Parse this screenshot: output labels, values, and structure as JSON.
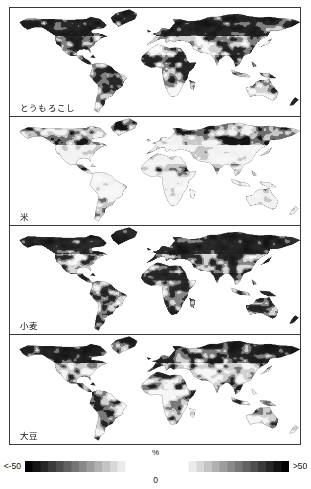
{
  "figure": {
    "panel_count": 4
  },
  "panels": [
    {
      "label": "とうもろこし",
      "crop_en": "maize"
    },
    {
      "label": "米",
      "crop_en": "rice"
    },
    {
      "label": "小麦",
      "crop_en": "wheat"
    },
    {
      "label": "大豆",
      "crop_en": "soybean"
    }
  ],
  "legend": {
    "left_label": "<-50",
    "right_label": ">50",
    "unit": "%",
    "center_label": "0",
    "low_color": "#000000",
    "high_color": "#000000",
    "mid_color": "#ffffff"
  },
  "chart_data": {
    "type": "heatmap",
    "subtitle": "",
    "xlabel": "",
    "ylabel": "",
    "grid": false,
    "legend_position": "bottom",
    "colorbar": {
      "unit": "%",
      "segments": [
        {
          "name": "negative",
          "from": -50,
          "to": 0,
          "from_label": "<-50",
          "to_label": "0",
          "color_from": "#000000",
          "color_to": "#ffffff"
        },
        {
          "name": "positive",
          "from": 0,
          "to": 50,
          "from_label": "0",
          "to_label": ">50",
          "color_from": "#ffffff",
          "color_to": "#000000"
        }
      ],
      "ticks": [
        -50,
        0,
        50
      ],
      "tick_labels": [
        "<-50",
        "0",
        ">50"
      ]
    },
    "projection": "equirectangular",
    "x": {
      "name": "longitude",
      "range": [
        -180,
        180
      ]
    },
    "y": {
      "name": "latitude",
      "range": [
        -60,
        85
      ]
    },
    "series": [
      {
        "name": "とうもろこし",
        "name_en": "maize",
        "panel_index": 0,
        "regions": [
          {
            "region": "North America (US Corn Belt)",
            "value": -35
          },
          {
            "region": "Mexico / Central America",
            "value": -42
          },
          {
            "region": "Brazil / Southern South America",
            "value": -48
          },
          {
            "region": "Sahel / West Africa",
            "value": -50
          },
          {
            "region": "Southern Africa",
            "value": -30
          },
          {
            "region": "Europe",
            "value": -20
          },
          {
            "region": "Northern Eurasia / Siberia",
            "value": -45
          },
          {
            "region": "South Asia",
            "value": -25
          },
          {
            "region": "East Asia (China)",
            "value": -22
          },
          {
            "region": "Southeast Asia",
            "value": -38
          },
          {
            "region": "Australia",
            "value": -15
          }
        ]
      },
      {
        "name": "米",
        "name_en": "rice",
        "panel_index": 1,
        "regions": [
          {
            "region": "North America",
            "value": -18
          },
          {
            "region": "Mexico / Central America",
            "value": -12
          },
          {
            "region": "Brazil / Southern South America",
            "value": -20
          },
          {
            "region": "Sahel / West Africa",
            "value": -10
          },
          {
            "region": "Southern Africa",
            "value": -8
          },
          {
            "region": "Europe",
            "value": -28
          },
          {
            "region": "Northern Eurasia / Siberia",
            "value": -40
          },
          {
            "region": "South Asia",
            "value": -14
          },
          {
            "region": "East Asia (China)",
            "value": -16
          },
          {
            "region": "Southeast Asia",
            "value": -12
          },
          {
            "region": "Australia",
            "value": -22
          }
        ]
      },
      {
        "name": "小麦",
        "name_en": "wheat",
        "panel_index": 2,
        "regions": [
          {
            "region": "North America",
            "value": -46
          },
          {
            "region": "Mexico / Central America",
            "value": -44
          },
          {
            "region": "Amazon / Brazil",
            "value": -50
          },
          {
            "region": "Southern South America",
            "value": -40
          },
          {
            "region": "Sahel / West Africa",
            "value": -48
          },
          {
            "region": "Central Africa",
            "value": -50
          },
          {
            "region": "Southern Africa",
            "value": -42
          },
          {
            "region": "Europe",
            "value": -25
          },
          {
            "region": "Northern Eurasia / Siberia",
            "value": -35
          },
          {
            "region": "South Asia",
            "value": -30
          },
          {
            "region": "East Asia (China)",
            "value": -26
          },
          {
            "region": "Southeast Asia",
            "value": -40
          },
          {
            "region": "Australia",
            "value": -18
          }
        ]
      },
      {
        "name": "大豆",
        "name_en": "soybean",
        "panel_index": 3,
        "regions": [
          {
            "region": "North America",
            "value": -30
          },
          {
            "region": "Mexico / Central America",
            "value": -24
          },
          {
            "region": "Brazil / Southern South America",
            "value": -28
          },
          {
            "region": "Sahel / West Africa",
            "value": -45
          },
          {
            "region": "Southern Africa",
            "value": -18
          },
          {
            "region": "Europe",
            "value": -22
          },
          {
            "region": "Northern Eurasia / Siberia",
            "value": -48
          },
          {
            "region": "South Asia",
            "value": -26
          },
          {
            "region": "East Asia (China)",
            "value": -24
          },
          {
            "region": "Southeast Asia",
            "value": -30
          },
          {
            "region": "Australia",
            "value": -32
          }
        ]
      }
    ]
  }
}
